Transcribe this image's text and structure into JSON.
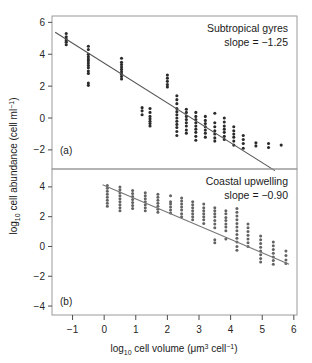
{
  "figure": {
    "background_color": "#ffffff",
    "frame_color": "#8c8c8c",
    "axis_color": "#4d4d4d",
    "point_color": "#2b2b2b",
    "line_color": "#555555"
  },
  "axes": {
    "x_label_prefix": "log",
    "x_label_sub": "10",
    "x_label_main": " cell volume (μm",
    "x_label_sup": "3",
    "x_label_tail": " cell",
    "x_label_sup2": "−1",
    "x_label_close": ")",
    "y_label_prefix": "log",
    "y_label_sub": "10",
    "y_label_main": " cell abundance (cell ml",
    "y_label_sup": "−1",
    "y_label_close": ")"
  },
  "chart_data": {
    "type": "scatter",
    "title": "",
    "xlabel": "log10 cell volume (μm3 cell−1)",
    "ylabel": "log10 cell abundance (cell ml−1)",
    "xlim": [
      -1.65,
      6.1
    ],
    "grid": false,
    "legend": "none",
    "shared_x_axis": true,
    "x_ticks": [
      -1,
      0,
      1,
      2,
      3,
      4,
      5,
      6
    ],
    "x_tick_labels": [
      "−1",
      "0",
      "1",
      "2",
      "3",
      "4",
      "5",
      "6"
    ],
    "panels": [
      {
        "tag": "(a)",
        "annotation_line1": "Subtropical gyres",
        "annotation_line2": "slope = −1.25",
        "slope": -1.25,
        "intercept": 3.45,
        "ylim": [
          -3.2,
          6.4
        ],
        "y_ticks": [
          -2,
          0,
          2,
          4,
          6
        ],
        "y_tick_labels": [
          "−2",
          "0",
          "2",
          "4",
          "6"
        ],
        "fit_line": {
          "x0": -1.55,
          "y0": 5.38,
          "x1": 5.4,
          "y1": -3.3
        },
        "clusters": [
          {
            "x": -1.2,
            "y_values": [
              5.3,
              5.1,
              4.95,
              4.85,
              4.75,
              4.6
            ]
          },
          {
            "x": -0.5,
            "y_values": [
              4.5,
              4.3,
              4.0,
              3.85,
              3.7,
              3.6,
              3.45,
              3.3,
              3.15,
              2.95,
              2.8,
              2.2,
              2.05
            ]
          },
          {
            "x": 0.55,
            "y_values": [
              3.75,
              3.5,
              3.35,
              3.2,
              3.05,
              2.9,
              2.75,
              2.6,
              2.45
            ]
          },
          {
            "x": 1.45,
            "y_values": [
              0.6,
              0.35,
              0.1,
              -0.05,
              -0.2,
              -0.35,
              -0.5
            ]
          },
          {
            "x": 1.2,
            "y_values": [
              0.65,
              0.45,
              0.2
            ]
          },
          {
            "x": 2.0,
            "y_values": [
              2.7,
              2.5,
              2.3,
              2.1,
              1.95
            ]
          },
          {
            "x": 2.3,
            "y_values": [
              1.4,
              1.15,
              0.9,
              0.6,
              0.4,
              0.2,
              0.0,
              -0.2,
              -0.4,
              -0.6,
              -0.85,
              -1.1
            ]
          },
          {
            "x": 2.6,
            "y_values": [
              0.55,
              0.35,
              0.1,
              -0.1,
              -0.3,
              -0.5,
              -0.75,
              -0.95
            ]
          },
          {
            "x": 2.9,
            "y_values": [
              0.35,
              0.1,
              -0.1,
              -0.3,
              -0.5,
              -0.7,
              -0.9,
              -1.15,
              -1.4
            ]
          },
          {
            "x": 3.2,
            "y_values": [
              0.1,
              -0.15,
              -0.35,
              -0.55,
              -0.75,
              -0.95,
              -1.2
            ]
          },
          {
            "x": 3.5,
            "y_values": [
              0.3,
              -0.3,
              -0.55,
              -0.8,
              -1.0,
              -1.25,
              -1.45
            ]
          },
          {
            "x": 3.8,
            "y_values": [
              0.0,
              -0.25,
              -0.5,
              -0.7,
              -0.9,
              -1.15,
              -1.35
            ]
          },
          {
            "x": 4.1,
            "y_values": [
              -0.55,
              -0.8,
              -1.0,
              -1.2,
              -1.45,
              -1.7
            ]
          },
          {
            "x": 4.4,
            "y_values": [
              -1.1,
              -1.35,
              -1.6,
              -1.9
            ]
          },
          {
            "x": 4.8,
            "y_values": [
              -1.55,
              -1.75
            ]
          },
          {
            "x": 5.2,
            "y_values": [
              -1.6,
              -1.85
            ]
          },
          {
            "x": 5.6,
            "y_values": [
              -1.7
            ]
          }
        ]
      },
      {
        "tag": "(b)",
        "annotation_line1": "Coastal upwelling",
        "annotation_line2": "slope = −0.90",
        "slope": -0.9,
        "intercept": 3.7,
        "ylim": [
          -4.6,
          5.2
        ],
        "y_ticks": [
          -4,
          -2,
          0,
          2,
          4
        ],
        "y_tick_labels": [
          "−4",
          "−2",
          "0",
          "2",
          "4"
        ],
        "fit_line": {
          "x0": -0.05,
          "y0": 4.15,
          "x1": 5.85,
          "y1": -1.2
        },
        "clusters": [
          {
            "x": 0.1,
            "y_values": [
              4.1,
              3.9,
              3.7,
              3.5,
              3.3,
              3.1,
              2.9,
              2.7
            ]
          },
          {
            "x": 0.5,
            "y_values": [
              4.0,
              3.8,
              3.6,
              3.4,
              3.2,
              3.0,
              2.8,
              2.6,
              2.4
            ]
          },
          {
            "x": 0.9,
            "y_values": [
              3.75,
              3.55,
              3.35,
              3.15,
              2.95,
              2.75,
              2.55
            ]
          },
          {
            "x": 1.3,
            "y_values": [
              3.6,
              3.4,
              3.2,
              3.0,
              2.8,
              2.6,
              2.4
            ]
          },
          {
            "x": 1.7,
            "y_values": [
              3.5,
              3.3,
              3.1,
              2.9,
              2.7,
              2.5,
              2.3
            ]
          },
          {
            "x": 2.1,
            "y_values": [
              3.4,
              3.0,
              2.85,
              2.65,
              2.45,
              2.25
            ]
          },
          {
            "x": 2.45,
            "y_values": [
              3.25,
              3.05,
              2.85,
              2.65,
              2.45,
              2.2,
              2.0
            ]
          },
          {
            "x": 2.8,
            "y_values": [
              3.0,
              2.8,
              2.6,
              2.4,
              2.2,
              2.0,
              1.8
            ]
          },
          {
            "x": 3.15,
            "y_values": [
              2.85,
              2.6,
              2.4,
              2.2,
              2.0,
              1.8,
              1.55
            ]
          },
          {
            "x": 3.5,
            "y_values": [
              2.6,
              2.4,
              2.2,
              2.0,
              1.75,
              1.5,
              1.25,
              0.45,
              0.25
            ]
          },
          {
            "x": 3.85,
            "y_values": [
              2.4,
              2.2,
              1.95,
              1.75,
              1.5,
              1.3,
              1.05,
              0.5
            ]
          },
          {
            "x": 4.2,
            "y_values": [
              2.55,
              2.3,
              2.05,
              1.8,
              1.55,
              1.3,
              1.05,
              0.8,
              0.55,
              0.3,
              0.0,
              -0.25
            ]
          },
          {
            "x": 4.55,
            "y_values": [
              1.5,
              1.25,
              1.0,
              0.75,
              0.5,
              0.25,
              0.0
            ]
          },
          {
            "x": 4.95,
            "y_values": [
              0.7,
              0.45,
              0.2,
              -0.05,
              -0.3,
              -0.55,
              -0.8,
              -1.05
            ]
          },
          {
            "x": 5.35,
            "y_values": [
              0.3,
              0.05,
              -0.2,
              -0.45,
              -0.7,
              -0.95,
              -1.2
            ]
          },
          {
            "x": 5.75,
            "y_values": [
              -0.3,
              -0.6,
              -0.9,
              -1.15
            ]
          }
        ]
      }
    ]
  }
}
